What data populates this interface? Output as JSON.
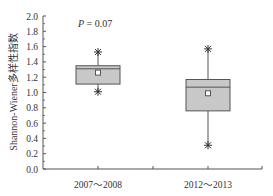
{
  "chart_data": {
    "type": "box",
    "title": "",
    "xlabel": "",
    "ylabel": "Shannon-Wiener多样性指数",
    "ylim": [
      0.0,
      2.0
    ],
    "yticks": [
      "0.0",
      "0.2",
      "0.4",
      "0.6",
      "0.8",
      "1.0",
      "1.2",
      "1.4",
      "1.6",
      "1.8",
      "2.0"
    ],
    "categories": [
      "2007～2008",
      "2012～2013"
    ],
    "annotation": "P = 0.07",
    "grid": false,
    "boxes": [
      {
        "name": "2007～2008",
        "min": 1.01,
        "q1": 1.11,
        "median": 1.31,
        "q3": 1.35,
        "max": 1.53,
        "mean": 1.26
      },
      {
        "name": "2012～2013",
        "min": 0.31,
        "q1": 0.76,
        "median": 1.07,
        "q3": 1.17,
        "max": 1.57,
        "mean": 0.99
      }
    ],
    "colors": {
      "box_fill": "#c8c8c8",
      "stroke": "#555555"
    }
  }
}
